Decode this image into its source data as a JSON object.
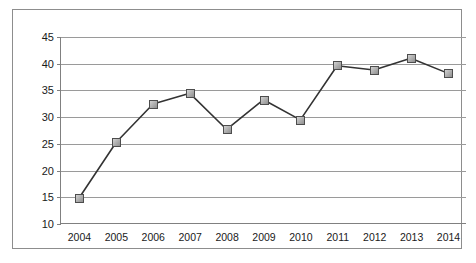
{
  "chart_data": {
    "type": "line",
    "title": "",
    "subtitle": "",
    "xlabel": "",
    "ylabel": "",
    "categories": [
      "2004",
      "2005",
      "2006",
      "2007",
      "2008",
      "2009",
      "2010",
      "2011",
      "2012",
      "2013",
      "2014"
    ],
    "values": [
      14.8,
      25.2,
      32.4,
      34.4,
      27.6,
      33.2,
      29.4,
      39.6,
      38.8,
      41.0,
      38.2
    ],
    "series": [
      {
        "name": "",
        "values": [
          14.8,
          25.2,
          32.4,
          34.4,
          27.6,
          33.2,
          29.4,
          39.6,
          38.8,
          41.0,
          38.2
        ]
      }
    ],
    "ylim": [
      10,
      45
    ],
    "ytick_labels": [
      "10",
      "15",
      "20",
      "25",
      "30",
      "35",
      "40",
      "45"
    ],
    "ytick_values": [
      10,
      15,
      20,
      25,
      30,
      35,
      40,
      45
    ],
    "xtick_labels": [
      "2004",
      "2005",
      "2006",
      "2007",
      "2008",
      "2009",
      "2010",
      "2011",
      "2012",
      "2013",
      "2014"
    ],
    "grid": "horizontal",
    "legend": "none",
    "annotations": [],
    "colors": {
      "line": "#333333",
      "marker_fill": "#b3b3b3",
      "marker_edge": "#4d4d4d",
      "gridline": "#9a9a9a",
      "axis": "#808080",
      "frame": "#8d8d8d",
      "background": "#ffffff",
      "text": "#1a1a1a"
    }
  }
}
